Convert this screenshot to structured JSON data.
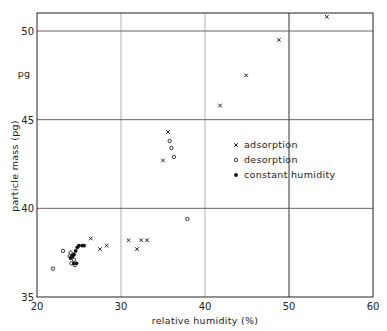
{
  "chart_data": {
    "type": "scatter",
    "title": "",
    "xlabel": "relative humidity (%)",
    "ylabel": "particle mass (pg)",
    "y_unit_label": "pg",
    "xlim": [
      20,
      60
    ],
    "ylim": [
      35,
      51.5
    ],
    "x_ticks": [
      20,
      30,
      40,
      50,
      60
    ],
    "y_ticks": [
      35,
      40,
      45,
      50
    ],
    "grid": true,
    "legend_position": "inside-right",
    "series": [
      {
        "name": "adsorption",
        "marker": "x",
        "points": [
          [
            26.4,
            38.3
          ],
          [
            27.5,
            37.7
          ],
          [
            28.3,
            37.9
          ],
          [
            30.9,
            38.2
          ],
          [
            31.9,
            37.7
          ],
          [
            32.4,
            38.2
          ],
          [
            33.1,
            38.2
          ],
          [
            35.0,
            42.7
          ],
          [
            35.6,
            44.3
          ],
          [
            41.8,
            45.8
          ],
          [
            44.9,
            47.5
          ],
          [
            48.8,
            49.5
          ],
          [
            54.5,
            50.8
          ]
        ]
      },
      {
        "name": "desorption",
        "marker": "o",
        "points": [
          [
            21.9,
            36.6
          ],
          [
            23.1,
            37.6
          ],
          [
            23.9,
            37.3
          ],
          [
            24.1,
            36.9
          ],
          [
            24.4,
            37.1
          ],
          [
            24.0,
            37.5
          ],
          [
            24.5,
            36.8
          ],
          [
            24.2,
            37.3
          ],
          [
            35.8,
            43.8
          ],
          [
            36.0,
            43.4
          ],
          [
            36.3,
            42.9
          ],
          [
            37.9,
            39.4
          ]
        ]
      },
      {
        "name": "constant humidity",
        "marker": "filled",
        "points": [
          [
            24.0,
            37.2
          ],
          [
            24.2,
            37.3
          ],
          [
            24.4,
            37.4
          ],
          [
            24.6,
            37.6
          ],
          [
            24.8,
            37.8
          ],
          [
            25.0,
            37.9
          ],
          [
            25.4,
            37.9
          ],
          [
            25.6,
            37.9
          ],
          [
            24.4,
            36.9
          ],
          [
            24.7,
            36.9
          ]
        ]
      }
    ]
  },
  "axes": {
    "x_tick_labels": [
      "20",
      "30",
      "40",
      "50",
      "60"
    ],
    "y_tick_labels": [
      "35",
      "40",
      "45",
      "50"
    ]
  },
  "legend": {
    "items": [
      {
        "symbol": "x",
        "label": "adsorption"
      },
      {
        "symbol": "o",
        "label": "desorption"
      },
      {
        "symbol": "•",
        "label": "constant humidity"
      }
    ]
  }
}
